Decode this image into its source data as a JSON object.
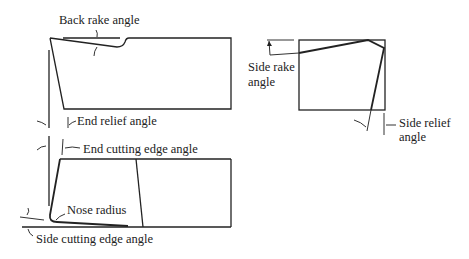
{
  "diagram": {
    "views": {
      "side_view": {
        "labels": {
          "back_rake": "Back rake angle",
          "end_relief": "End relief angle"
        }
      },
      "plan_view": {
        "labels": {
          "end_cutting_edge": "End cutting edge angle",
          "nose_radius": "Nose radius",
          "side_cutting_edge": "Side cutting edge angle"
        }
      },
      "end_view": {
        "labels": {
          "side_rake_line1": "Side rake",
          "side_rake_line2": "angle",
          "side_relief_line1": "Side relief",
          "side_relief_line2": "angle"
        }
      }
    },
    "colors": {
      "stroke": "#222222",
      "background": "#ffffff"
    }
  }
}
